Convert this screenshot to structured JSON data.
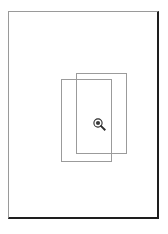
{
  "app": {
    "title": "Drawing Canvas",
    "background_color": "#ffffff"
  },
  "canvas": {
    "name": "page-sheet",
    "background_color": "#ffffff",
    "border_color_light": "#9a9a9a",
    "border_color_shadow": "#1e1e1e",
    "width": 151,
    "height": 208
  },
  "shapes": [
    {
      "id": "rect-1",
      "type": "rectangle",
      "label": "Rectangle 1",
      "x": 52,
      "y": 67,
      "width": 51,
      "height": 83,
      "stroke_color": "#9b9b9b",
      "fill": "none"
    },
    {
      "id": "rect-2",
      "type": "rectangle",
      "label": "Rectangle 2",
      "x": 67,
      "y": 61,
      "width": 51,
      "height": 81,
      "stroke_color": "#9b9b9b",
      "fill": "none"
    }
  ],
  "cursor": {
    "icon": "magnifier-zoom-icon",
    "label": "Zoom",
    "x": 84,
    "y": 106,
    "color": "#2b2b2b"
  }
}
